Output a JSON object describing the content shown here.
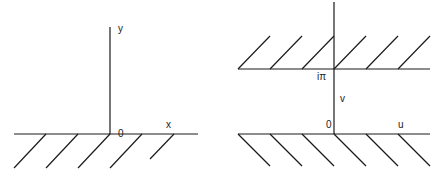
{
  "left_diagram": {
    "name": "z-plane upper half-plane",
    "labels": {
      "y_axis": "y",
      "x_axis": "x",
      "origin": "0"
    }
  },
  "right_diagram": {
    "name": "w-plane strip",
    "labels": {
      "top_boundary": "iπ",
      "v_axis": "v",
      "origin": "0",
      "u_axis": "u"
    }
  },
  "colors": {
    "line": "#1a1a1a",
    "background": "#ffffff"
  }
}
